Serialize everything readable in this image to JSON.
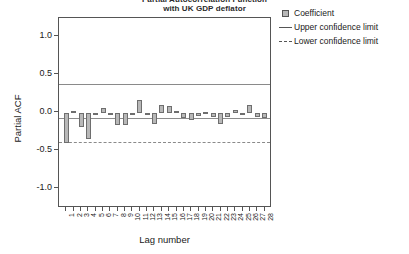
{
  "chart_data": {
    "type": "bar",
    "title": "Partial Autocorrelation Function",
    "title_line2": "with UK GDP deflator",
    "xlabel": "Lag number",
    "ylabel": "Partial ACF",
    "ylim": [
      -1.25,
      1.25
    ],
    "yticks": [
      "1.0",
      "0.5",
      "0.0",
      "-0.5",
      "-1.0"
    ],
    "ytick_values": [
      1.0,
      0.5,
      0.0,
      -0.5,
      -1.0
    ],
    "grid": false,
    "legend_position": "right",
    "categories": [
      "1",
      "2",
      "3",
      "4",
      "5",
      "6",
      "7",
      "8",
      "9",
      "10",
      "11",
      "12",
      "13",
      "14",
      "15",
      "16",
      "17",
      "18",
      "19",
      "20",
      "21",
      "22",
      "23",
      "24",
      "25",
      "26",
      "27",
      "28"
    ],
    "values": [
      -0.4,
      0.03,
      -0.19,
      -0.34,
      -0.03,
      0.06,
      -0.01,
      -0.16,
      -0.16,
      -0.01,
      0.17,
      -0.01,
      -0.15,
      0.1,
      0.09,
      0.02,
      -0.06,
      -0.09,
      -0.04,
      0.01,
      -0.05,
      -0.15,
      -0.05,
      0.04,
      -0.03,
      0.1,
      -0.05,
      -0.07
    ],
    "tail_values": [
      0.03
    ],
    "confidence": {
      "upper": 0.38,
      "lower": -0.38
    },
    "series": [
      {
        "name": "Coefficient",
        "values": [
          -0.4,
          0.03,
          -0.19,
          -0.34,
          -0.03,
          0.06,
          -0.01,
          -0.16,
          -0.16,
          -0.01,
          0.17,
          -0.01,
          -0.15,
          0.1,
          0.09,
          0.02,
          -0.06,
          -0.09,
          -0.04,
          0.01,
          -0.05,
          -0.15,
          -0.05,
          0.04,
          -0.03,
          0.1,
          -0.05,
          -0.07
        ]
      }
    ],
    "colors": {
      "bar_fill": "#b8b8b8",
      "bar_border": "#6e6e6e",
      "axis": "#555555",
      "confidence_line": "#8a8a8a",
      "zero_line": "#8c8c8c"
    }
  },
  "legend": {
    "items": [
      {
        "label": "Coefficient",
        "key": "swatch"
      },
      {
        "label": "Upper confidence limit",
        "key": "solid-line"
      },
      {
        "label": "Lower confidence limit",
        "key": "dashed-line"
      }
    ]
  }
}
